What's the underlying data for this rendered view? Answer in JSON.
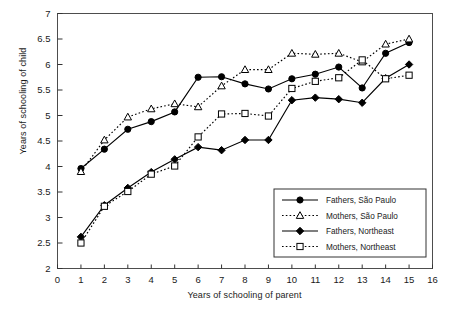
{
  "chart_data": {
    "type": "line",
    "title": "",
    "xlabel": "Years of schooling of parent",
    "ylabel": "Years of schooling of child",
    "xlim": [
      0,
      16
    ],
    "ylim": [
      2,
      7
    ],
    "xticks": [
      0,
      1,
      2,
      3,
      4,
      5,
      6,
      7,
      8,
      9,
      10,
      11,
      12,
      13,
      14,
      15,
      16
    ],
    "yticks": [
      2,
      2.5,
      3,
      3.5,
      4,
      4.5,
      5,
      5.5,
      6,
      6.5,
      7
    ],
    "ytick_labels": [
      "2",
      "2.5",
      "3",
      "3.5",
      "4",
      "4.5",
      "5",
      "5.5",
      "6",
      "6.5",
      "7"
    ],
    "xtick_labels": [
      "0",
      "1",
      "2",
      "3",
      "4",
      "5",
      "6",
      "7",
      "8",
      "9",
      "10",
      "11",
      "12",
      "13",
      "14",
      "15",
      "16"
    ],
    "grid": false,
    "legend_position": "lower-right",
    "x": [
      1,
      2,
      3,
      4,
      5,
      6,
      7,
      8,
      9,
      10,
      11,
      12,
      13,
      14,
      15
    ],
    "series": [
      {
        "name": "Fathers, São Paulo",
        "marker": "filled-circle",
        "linestyle": "solid",
        "color": "#000000",
        "values": [
          3.96,
          4.34,
          4.73,
          4.88,
          5.07,
          5.75,
          5.76,
          5.62,
          5.52,
          5.72,
          5.81,
          5.95,
          5.54,
          6.22,
          6.43
        ]
      },
      {
        "name": "Mothers, São Paulo",
        "marker": "open-triangle",
        "linestyle": "dotted",
        "color": "#000000",
        "values": [
          3.9,
          4.52,
          4.97,
          5.13,
          5.23,
          5.17,
          5.58,
          5.9,
          5.9,
          6.22,
          6.2,
          6.22,
          6.05,
          6.4,
          6.5
        ]
      },
      {
        "name": "Fathers, Northeast",
        "marker": "filled-diamond",
        "linestyle": "solid",
        "color": "#000000",
        "values": [
          2.62,
          3.24,
          3.58,
          3.89,
          4.14,
          4.38,
          4.32,
          4.52,
          4.52,
          5.3,
          5.35,
          5.32,
          5.25,
          5.73,
          6.0
        ]
      },
      {
        "name": "Mothers, Northeast",
        "marker": "open-square",
        "linestyle": "dotted",
        "color": "#000000",
        "values": [
          2.5,
          3.22,
          3.51,
          3.85,
          4.01,
          4.58,
          5.03,
          5.04,
          4.99,
          5.53,
          5.67,
          5.74,
          6.09,
          5.72,
          5.79
        ]
      }
    ]
  },
  "axes": {
    "ylabel": "Years of schooling of child",
    "xlabel": "Years of schooling of parent"
  },
  "legend": {
    "entries": [
      "Fathers, São Paulo",
      "Mothers, São Paulo",
      "Fathers, Northeast",
      "Mothers, Northeast"
    ]
  }
}
